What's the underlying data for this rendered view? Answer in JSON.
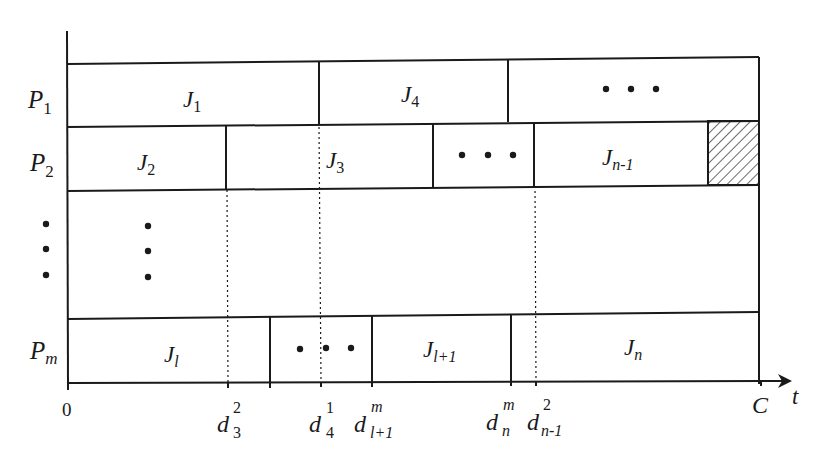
{
  "diagram": {
    "type": "gantt-schedule",
    "colors": {
      "line": "#1a1a1a",
      "background": "#ffffff",
      "hatch": "#1a1a1a"
    },
    "machines": [
      {
        "id": "P1",
        "label": "P",
        "sub": "1"
      },
      {
        "id": "P2",
        "label": "P",
        "sub": "2"
      },
      {
        "id": "Pm",
        "label": "P",
        "sub": "m"
      }
    ],
    "jobs": {
      "J1": {
        "label": "J",
        "sub": "1"
      },
      "J4": {
        "label": "J",
        "sub": "4"
      },
      "J2": {
        "label": "J",
        "sub": "2"
      },
      "J3": {
        "label": "J",
        "sub": "3"
      },
      "Jn1": {
        "label": "J",
        "sub": "n-1"
      },
      "Jl": {
        "label": "J",
        "sub": "l"
      },
      "Jl1": {
        "label": "J",
        "sub": "l+1"
      },
      "Jn": {
        "label": "J",
        "sub": "n"
      }
    },
    "ellipsis": "• • •",
    "axis": {
      "origin": "0",
      "end": "C",
      "variable": "t",
      "ticks": [
        {
          "id": "d3_2",
          "base": "d",
          "sup": "2",
          "sub": "3"
        },
        {
          "id": "d4_1",
          "base": "d",
          "sup": "1",
          "sub": "4"
        },
        {
          "id": "dl1_m",
          "base": "d",
          "sup": "m",
          "sub": "l+1"
        },
        {
          "id": "dn_m",
          "base": "d",
          "sup": "m",
          "sub": "n"
        },
        {
          "id": "dn1_2",
          "base": "d",
          "sup": "2",
          "sub": "n-1"
        }
      ]
    },
    "idle_block": {
      "machine": "P2",
      "pattern": "hatched"
    }
  }
}
